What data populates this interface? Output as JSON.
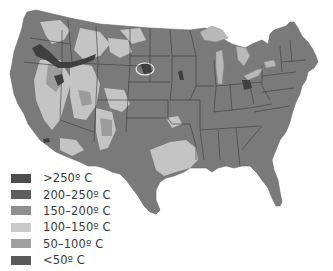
{
  "map": {
    "title": "",
    "region": "Contiguous United States",
    "colors": {
      "c250": "#4d4d4d",
      "c200": "#5e5e5e",
      "c150": "#8f8f8f",
      "c100": "#bdbdbd",
      "c50": "#a5a5a5",
      "c0": "#6f6f6f",
      "border": "#3c3c3c",
      "lake": "#b5b5b5"
    }
  },
  "legend": {
    "items": [
      {
        "label": ">250º C",
        "color": "#4d4d4d"
      },
      {
        "label": "200–250º C",
        "color": "#5e5e5e"
      },
      {
        "label": "150–200º C",
        "color": "#8f8f8f"
      },
      {
        "label": "100–150º C",
        "color": "#c9c9c9"
      },
      {
        "label": "50–100º C",
        "color": "#a0a0a0"
      },
      {
        "label": "<50º C",
        "color": "#5a5a5a"
      }
    ]
  }
}
